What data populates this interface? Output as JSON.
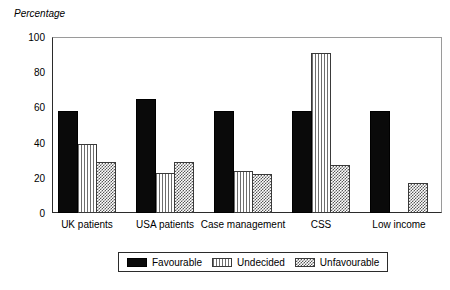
{
  "chart_data": {
    "type": "bar",
    "title": "",
    "subtitle": "",
    "xlabel": "",
    "ylabel": "Percentage",
    "ylim": [
      0,
      100
    ],
    "yticks": [
      0,
      20,
      40,
      60,
      80,
      100
    ],
    "ytick_labels": [
      "0",
      "20",
      "40",
      "60",
      "80",
      "100"
    ],
    "grid": false,
    "legend_position": "bottom-center",
    "categories": [
      "UK patients",
      "USA patients",
      "Case management",
      "CSS",
      "Low income"
    ],
    "series": [
      {
        "name": "Favourable",
        "pattern": "solid-black",
        "values": [
          58,
          65,
          58,
          58,
          58
        ]
      },
      {
        "name": "Undecided",
        "pattern": "vertical-stripes",
        "values": [
          39,
          23,
          24,
          91,
          null
        ]
      },
      {
        "name": "Unfavourable",
        "pattern": "checkered-hatch",
        "values": [
          29,
          29,
          22,
          27,
          17
        ]
      }
    ]
  },
  "legend": {
    "entries": [
      {
        "label": "Favourable",
        "pattern": "solid-black"
      },
      {
        "label": "Undecided",
        "pattern": "vertical-stripes"
      },
      {
        "label": "Unfavourable",
        "pattern": "checkered-hatch"
      }
    ]
  },
  "colors": {
    "favourable": "#0a0a0a",
    "undecided": "#6e6e6e",
    "unfavourable": "#585858",
    "axis": "#2b2b2b",
    "frame": "#9a9a9a",
    "background": "#ffffff"
  }
}
